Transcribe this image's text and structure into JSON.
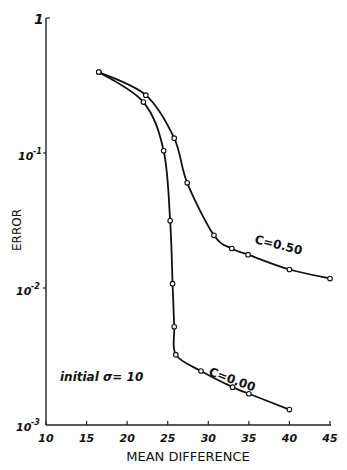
{
  "chart_data": {
    "type": "line",
    "title": "",
    "xlabel": "MEAN DIFFERENCE",
    "ylabel": "ERROR",
    "xscale": "linear",
    "yscale": "log",
    "xlim": [
      10,
      45
    ],
    "ylim": [
      0.001,
      1
    ],
    "grid": false,
    "legend_position": "inline labels on curves",
    "x_ticks": [
      10,
      15,
      20,
      25,
      30,
      35,
      40,
      45
    ],
    "y_ticks": [
      {
        "value": 1,
        "label": "1"
      },
      {
        "value": 0.1,
        "label": "10-1"
      },
      {
        "value": 0.01,
        "label": "10-2"
      },
      {
        "value": 0.001,
        "label": "10-3"
      }
    ],
    "annotations": [
      {
        "text": "initial σ= 10"
      },
      {
        "text": "C=0.50"
      },
      {
        "text": "C=0.00"
      }
    ],
    "series": [
      {
        "name": "C=0.50",
        "x": [
          16.5,
          22.3,
          25.8,
          27.4,
          30.7,
          32.9,
          34.9,
          40,
          45
        ],
        "y": [
          0.4,
          0.27,
          0.13,
          0.061,
          0.025,
          0.02,
          0.018,
          0.014,
          0.012
        ]
      },
      {
        "name": "C=0.00",
        "x": [
          16.5,
          22.0,
          24.5,
          25.3,
          25.6,
          25.8,
          26.0,
          29.1,
          33.0,
          35.0,
          40.0
        ],
        "y": [
          0.4,
          0.24,
          0.105,
          0.032,
          0.011,
          0.0053,
          0.0033,
          0.0025,
          0.0019,
          0.0017,
          0.0013
        ]
      }
    ]
  },
  "labels": {
    "x_axis_title": "MEAN DIFFERENCE",
    "y_axis_title": "ERROR",
    "y_tick_1": "1",
    "y_tick_base": "10",
    "y_exp_1": "-1",
    "y_exp_2": "-2",
    "y_exp_3": "-3",
    "x_ticks": [
      "10",
      "15",
      "20",
      "25",
      "30",
      "35",
      "40",
      "45"
    ],
    "curve_050": "C=0.50",
    "curve_000": "C=0.00",
    "initial_sigma": "initial σ= 10"
  }
}
